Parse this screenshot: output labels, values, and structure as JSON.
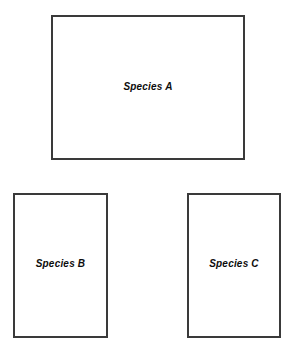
{
  "diagram": {
    "type": "labeled-rectangles",
    "background_color": "#ffffff",
    "border_color": "#3a3a3a",
    "label_color": "#0d0d0d",
    "boxes": [
      {
        "id": "species-a",
        "label": "Species A",
        "x": 51,
        "y": 15,
        "width": 194,
        "height": 145
      },
      {
        "id": "species-b",
        "label": "Species B",
        "x": 13,
        "y": 193,
        "width": 95,
        "height": 145
      },
      {
        "id": "species-c",
        "label": "Species C",
        "x": 187,
        "y": 193,
        "width": 94,
        "height": 145
      }
    ]
  }
}
